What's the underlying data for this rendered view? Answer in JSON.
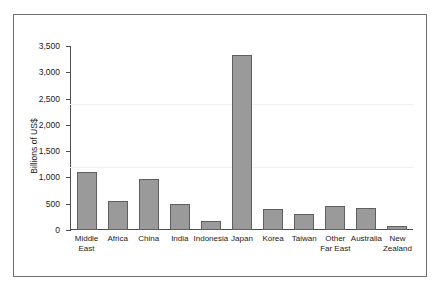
{
  "chart_data": {
    "type": "bar",
    "title": "",
    "xlabel": "",
    "ylabel": "Billions of US$",
    "ylim": [
      0,
      3500
    ],
    "ytick_step": 500,
    "yticks": [
      0,
      500,
      1000,
      1500,
      2000,
      2500,
      3000,
      3500
    ],
    "ytick_labels": [
      "0",
      "500",
      "1,000",
      "1,500",
      "2,000",
      "2,500",
      "3,000",
      "3,500"
    ],
    "grid": false,
    "legend": "none",
    "bar_color": "#9a9a9a",
    "bar_edge_color": "#5f5f5f",
    "categories": [
      "Middle\nEast",
      "Africa",
      "China",
      "India",
      "Indonesia",
      "Japan",
      "Korea",
      "Taiwan",
      "Other\nFar East",
      "Australia",
      "New\nZealand"
    ],
    "values": [
      1110,
      550,
      975,
      490,
      175,
      3330,
      400,
      300,
      460,
      410,
      70
    ]
  },
  "figure": {
    "frame_color": "#6e6e6e",
    "background": "#ffffff"
  }
}
